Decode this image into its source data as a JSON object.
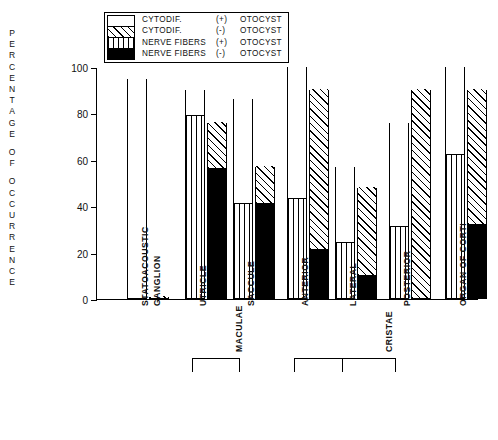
{
  "chart_data": {
    "type": "bar",
    "title": "",
    "xlabel": "",
    "ylabel": "PERCENTAGE OF OCCURRENCE",
    "ylim": [
      0,
      100
    ],
    "yticks": [
      0,
      20,
      40,
      60,
      80,
      100
    ],
    "grid": false,
    "legend_position": "top-center",
    "legend": [
      {
        "label_a": "CYTODIF.",
        "label_b": "(+)",
        "label_c": "OTOCYST",
        "pattern": "open-white"
      },
      {
        "label_a": "CYTODIF.",
        "label_b": "(-)",
        "label_c": "OTOCYST",
        "pattern": "diagonal-hatch"
      },
      {
        "label_a": "NERVE FIBERS",
        "label_b": "(+)",
        "label_c": "OTOCYST",
        "pattern": "vertical-stripe"
      },
      {
        "label_a": "NERVE FIBERS",
        "label_b": "(-)",
        "label_c": "OTOCYST",
        "pattern": "solid-black"
      }
    ],
    "categories": [
      "STATOACOUSTIC GANGLION",
      "UTRICLE",
      "SACCULE",
      "ANTERIOR",
      "LATERAL",
      "POSTERIOR",
      "ORGAN OF CORTI"
    ],
    "category_groups": [
      {
        "name": "MACULAE",
        "members": [
          "UTRICLE",
          "SACCULE"
        ]
      },
      {
        "name": "CRISTAE",
        "members": [
          "ANTERIOR",
          "LATERAL",
          "POSTERIOR"
        ]
      }
    ],
    "series": [
      {
        "name": "CYTODIF. (+) OTOCYST",
        "values": [
          95,
          90,
          86,
          100,
          57,
          76,
          100
        ]
      },
      {
        "name": "NERVE FIBERS (+) OTOCYST",
        "values": [
          0,
          79,
          41,
          43,
          24,
          31,
          62
        ]
      },
      {
        "name": "CYTODIF. (-) OTOCYST",
        "values": [
          1,
          76,
          57,
          90,
          48,
          90,
          90
        ]
      },
      {
        "name": "NERVE FIBERS (-) OTOCYST",
        "values": [
          0,
          56,
          41,
          21,
          10,
          0,
          32
        ]
      }
    ]
  },
  "axis": {
    "y_title_letters": [
      "P",
      "E",
      "R",
      "C",
      "E",
      "N",
      "T",
      "A",
      "G",
      "E",
      "",
      "O",
      "F",
      "",
      "O",
      "C",
      "C",
      "U",
      "R",
      "R",
      "E",
      "N",
      "C",
      "E"
    ],
    "tick_labels": [
      "100",
      "80",
      "60",
      "40",
      "20",
      "0"
    ]
  }
}
